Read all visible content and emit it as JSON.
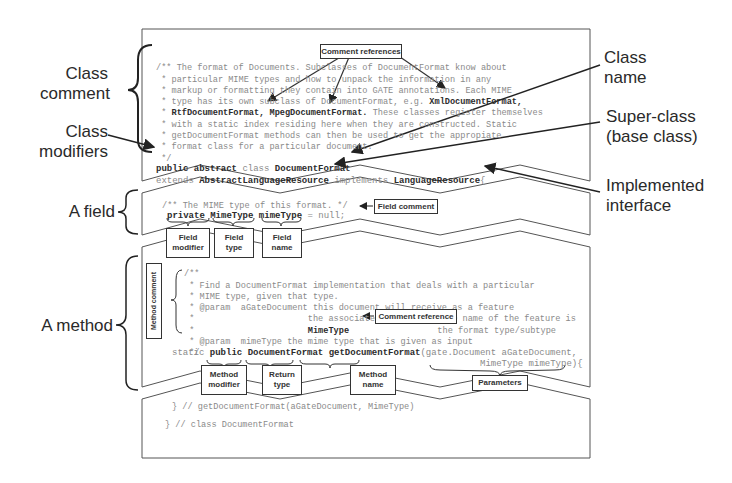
{
  "left_labels": {
    "class_comment": [
      "Class",
      "comment"
    ],
    "class_modifiers": [
      "Class",
      "modifiers"
    ],
    "a_field": "A field",
    "a_method": "A method"
  },
  "right_labels": {
    "class_name": [
      "Class",
      "name"
    ],
    "super_class": [
      "Super-class",
      "(base class)"
    ],
    "implemented_interface": [
      "Implemented",
      "interface"
    ]
  },
  "callouts": {
    "comment_references": "Comment references",
    "field_comment": "Field comment",
    "field_modifier": [
      "Field",
      "modifier"
    ],
    "field_type": [
      "Field",
      "type"
    ],
    "field_name": [
      "Field",
      "name"
    ],
    "method_comment": "Method comment",
    "comment_reference": "Comment reference",
    "method_modifier": [
      "Method",
      "modifier"
    ],
    "return_type": [
      "Return",
      "type"
    ],
    "method_name": [
      "Method",
      "name"
    ],
    "parameters": "Parameters"
  },
  "code": {
    "class_comment_lines": [
      "/** The format of Documents. Subclasses of DocumentFormat know about",
      " * particular MIME types and how to unpack the information in any",
      " * markup or formatting they contain into GATE annotations. Each MIME",
      " * type has its own subclass of DocumentFormat, e.g. ",
      " * ",
      " * with a static index residing here when they are constructed. Static",
      " * getDocumentFormat methods can then be used to get the appropiate",
      " * format class for a particular document.",
      " */"
    ],
    "ref_xml": "XmlDocumentFormat,",
    "ref_rtf": "RtfDocumentFormat,",
    "ref_mpeg": "MpegDocumentFormat.",
    "ref_tail": " These classes register themselves",
    "class_decl_1": [
      "public abstract ",
      "class ",
      "DocumentFormat"
    ],
    "class_decl_2": [
      "extends ",
      "AbstractLanguageResource",
      " implements ",
      "LanguageResource",
      "{"
    ],
    "field_comment": "/** The MIME type of this format. */",
    "field_decl": [
      "private ",
      "MimeType ",
      "mimeType",
      " = null;"
    ],
    "method_comment_lines": [
      "/**",
      " * Find a DocumentFormat implementation that deals with a particular",
      " * MIME type, given that type.",
      " * @param  aGateDocument this document will receive as a feature",
      " *                      the associated Mime Type. The name of the feature is",
      " *                      ",
      " * @param  mimeType the mime type that is given as input",
      " */"
    ],
    "method_ref": "MimeType",
    "method_ref_tail": "  the format type/subtype",
    "method_decl_1": [
      "static ",
      "public ",
      "DocumentFormat ",
      "getDocumentFormat",
      "(gate.Document aGateDocument,"
    ],
    "method_decl_2": "MimeType mimeType){",
    "method_end": "} // getDocumentFormat(aGateDocument, MimeType)",
    "class_end": "} // class DocumentFormat"
  }
}
